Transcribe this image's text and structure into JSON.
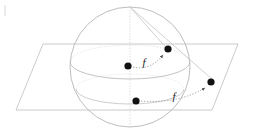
{
  "figure": {
    "background_color": "#ffffff",
    "width": 253,
    "height": 137,
    "line_color_plane": "#b9b9b9",
    "line_color_sphere": "#b5b5b5",
    "line_color_hidden": "#cfcfcf",
    "point_color": "#111111",
    "arrow_color": "#4a4a4a",
    "label_color": "#1a1a1a"
  },
  "plane": {
    "name": "projection-plane",
    "corners": [
      {
        "x": 43,
        "y": 44
      },
      {
        "x": 238,
        "y": 44
      },
      {
        "x": 212,
        "y": 110
      },
      {
        "x": 16,
        "y": 110
      }
    ]
  },
  "sphere": {
    "name": "sphere",
    "center": {
      "x": 130,
      "y": 67
    },
    "radius": 60,
    "equator": {
      "cx": 130,
      "cy": 62,
      "rx": 60,
      "ry": 17
    },
    "lower_latitude": {
      "cx": 130,
      "cy": 89,
      "rx": 54,
      "ry": 15
    },
    "north_pole": {
      "x": 130,
      "y": 7
    }
  },
  "points": [
    {
      "id": "p-sphere-upper-left",
      "label": "",
      "x": 128,
      "y": 66,
      "r": 3.6
    },
    {
      "id": "p-sphere-upper-right",
      "label": "",
      "x": 168,
      "y": 49,
      "r": 3.6
    },
    {
      "id": "p-sphere-lower",
      "label": "",
      "x": 136,
      "y": 101,
      "r": 3.6
    },
    {
      "id": "p-plane-right",
      "label": "",
      "x": 211,
      "y": 82,
      "r": 3.6
    }
  ],
  "arrows": [
    {
      "id": "arrow-upper",
      "label": "f",
      "label_x": 146,
      "label_y": 64,
      "from": {
        "x": 132,
        "y": 67
      },
      "to": {
        "x": 166,
        "y": 53
      }
    },
    {
      "id": "arrow-lower",
      "label": "f",
      "label_x": 175,
      "label_y": 98,
      "from": {
        "x": 140,
        "y": 101
      },
      "to": {
        "x": 208,
        "y": 86
      }
    }
  ],
  "projection_rays": [
    {
      "id": "ray-pole-to-upper-right",
      "from": {
        "x": 130,
        "y": 7
      },
      "to": {
        "x": 213,
        "y": 80
      }
    },
    {
      "id": "ray-pole-to-lower",
      "from": {
        "x": 130,
        "y": 7
      },
      "to": {
        "x": 168,
        "y": 50
      }
    }
  ],
  "meridian": {
    "id": "meridian-axis",
    "from": {
      "x": 130,
      "y": 7
    },
    "to": {
      "x": 130,
      "y": 127
    }
  },
  "stray_mark": {
    "id": "stray-mark-topleft",
    "x": 4,
    "y": 5,
    "width": 2,
    "height": 11,
    "color": "#ececec"
  }
}
